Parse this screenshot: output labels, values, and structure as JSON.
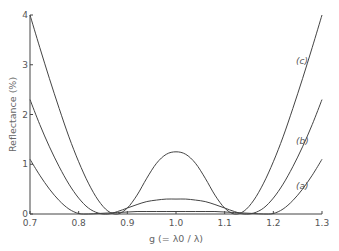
{
  "chart_data": {
    "type": "line",
    "title": "",
    "xlabel": "g (= λ0 / λ)",
    "ylabel": "Reflectance (%)",
    "xlim": [
      0.7,
      1.3
    ],
    "ylim": [
      0,
      4
    ],
    "x_ticks": [
      "0.7",
      "0.8",
      "0.9",
      "1.0",
      "1.1",
      "1.2",
      "1.3"
    ],
    "y_ticks": [
      "0",
      "1",
      "2",
      "3",
      "4"
    ],
    "grid": false,
    "x": [
      0.7,
      0.72,
      0.74,
      0.76,
      0.78,
      0.8,
      0.82,
      0.84,
      0.86,
      0.88,
      0.9,
      0.92,
      0.94,
      0.96,
      0.98,
      1.0,
      1.02,
      1.04,
      1.06,
      1.08,
      1.1,
      1.12,
      1.14,
      1.16,
      1.18,
      1.2,
      1.22,
      1.24,
      1.26,
      1.28,
      1.3
    ],
    "series": [
      {
        "name": "(a)",
        "label": "(a)",
        "values": [
          1.1,
          0.78,
          0.5,
          0.27,
          0.1,
          0.01,
          0.0,
          0.01,
          0.02,
          0.03,
          0.04,
          0.05,
          0.05,
          0.05,
          0.05,
          0.05,
          0.05,
          0.05,
          0.05,
          0.05,
          0.04,
          0.03,
          0.02,
          0.01,
          0.0,
          0.01,
          0.1,
          0.27,
          0.5,
          0.78,
          1.1
        ]
      },
      {
        "name": "(b)",
        "label": "(b)",
        "values": [
          2.3,
          1.8,
          1.35,
          0.95,
          0.6,
          0.32,
          0.12,
          0.02,
          0.0,
          0.05,
          0.12,
          0.19,
          0.25,
          0.28,
          0.3,
          0.3,
          0.3,
          0.28,
          0.25,
          0.19,
          0.12,
          0.05,
          0.0,
          0.02,
          0.12,
          0.32,
          0.6,
          0.95,
          1.35,
          1.8,
          2.3
        ]
      },
      {
        "name": "(c)",
        "label": "(c)",
        "values": [
          4.0,
          3.35,
          2.72,
          2.12,
          1.55,
          1.05,
          0.62,
          0.28,
          0.06,
          0.0,
          0.12,
          0.38,
          0.72,
          1.02,
          1.2,
          1.25,
          1.2,
          1.02,
          0.72,
          0.38,
          0.12,
          0.0,
          0.06,
          0.28,
          0.62,
          1.05,
          1.55,
          2.12,
          2.72,
          3.35,
          4.0
        ]
      }
    ],
    "annotations": [
      "(c)",
      "(b)",
      "(a)"
    ],
    "legend_position": "none"
  }
}
